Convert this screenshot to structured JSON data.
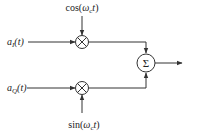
{
  "diagram": {
    "title": "",
    "type": "IQ modulator block diagram",
    "inputs": [
      {
        "id": "aI",
        "label_main": "a",
        "label_sub": "I",
        "label_arg": "(t)"
      },
      {
        "id": "aQ",
        "label_main": "a",
        "label_sub": "Q",
        "label_arg": "(t)"
      }
    ],
    "carriers": [
      {
        "id": "cos",
        "label_fn": "cos(",
        "label_omega": "ω",
        "label_sub": "c",
        "label_t": "t",
        "label_close": ")"
      },
      {
        "id": "sin",
        "label_fn": "sin(",
        "label_omega": "ω",
        "label_sub": "c",
        "label_t": "t",
        "label_close": ")"
      }
    ],
    "nodes": [
      {
        "id": "mult_top",
        "kind": "multiplier",
        "symbol": "⊗"
      },
      {
        "id": "mult_bottom",
        "kind": "multiplier",
        "symbol": "⊗"
      },
      {
        "id": "summer",
        "kind": "adder",
        "symbol": "Σ"
      }
    ],
    "edges": [
      {
        "from": "aI",
        "to": "mult_top"
      },
      {
        "from": "cos",
        "to": "mult_top"
      },
      {
        "from": "aQ",
        "to": "mult_bottom"
      },
      {
        "from": "sin",
        "to": "mult_bottom"
      },
      {
        "from": "mult_top",
        "to": "summer"
      },
      {
        "from": "mult_bottom",
        "to": "summer"
      },
      {
        "from": "summer",
        "to": "output"
      }
    ],
    "colors": {
      "stroke": "#333333",
      "text": "#222222",
      "background": "#ffffff"
    }
  }
}
